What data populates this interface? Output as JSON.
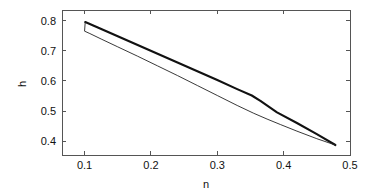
{
  "chart_data": {
    "type": "line",
    "title": "",
    "xlabel": "n",
    "ylabel": "h",
    "xlim": [
      0.066,
      0.5
    ],
    "ylim": [
      0.355,
      0.835
    ],
    "grid": false,
    "legend": null,
    "xticks": [
      0.1,
      0.2,
      0.3,
      0.4,
      0.5
    ],
    "xtick_labels": [
      "0.1",
      "0.2",
      "0.3",
      "0.4",
      "0.5"
    ],
    "yticks": [
      0.4,
      0.5,
      0.6,
      0.7,
      0.8
    ],
    "ytick_labels": [
      "0.4",
      "0.5",
      "0.6",
      "0.7",
      "0.8"
    ],
    "series": [
      {
        "name": "upper-branch",
        "style": "thick-solid",
        "color": "#111111",
        "x": [
          0.101,
          0.12,
          0.15,
          0.18,
          0.21,
          0.24,
          0.27,
          0.3,
          0.33,
          0.352,
          0.365,
          0.39,
          0.42,
          0.45,
          0.478
        ],
        "y": [
          0.795,
          0.777,
          0.748,
          0.719,
          0.69,
          0.661,
          0.632,
          0.603,
          0.573,
          0.552,
          0.534,
          0.496,
          0.461,
          0.424,
          0.388
        ]
      },
      {
        "name": "lower-branch",
        "style": "thin-solid",
        "color": "#222222",
        "x": [
          0.478,
          0.45,
          0.42,
          0.395,
          0.375,
          0.355,
          0.33,
          0.3,
          0.27,
          0.24,
          0.21,
          0.18,
          0.15,
          0.125,
          0.108,
          0.1,
          0.101
        ],
        "y": [
          0.388,
          0.409,
          0.434,
          0.456,
          0.474,
          0.493,
          0.519,
          0.552,
          0.585,
          0.618,
          0.65,
          0.682,
          0.713,
          0.739,
          0.757,
          0.765,
          0.795
        ]
      }
    ],
    "annotations": [
      {
        "name": "loop-left-tip",
        "x": 0.101,
        "y": 0.78
      },
      {
        "name": "loop-right-tip",
        "x": 0.478,
        "y": 0.388
      },
      {
        "name": "branch-crossing",
        "x": 0.333,
        "y": 0.57
      }
    ]
  },
  "axes": {
    "x_label": "n",
    "y_label": "h"
  }
}
